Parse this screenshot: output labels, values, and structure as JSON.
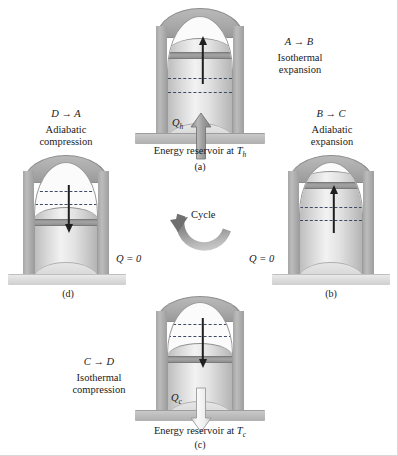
{
  "figure": {
    "center_label": "Cycle",
    "colors": {
      "background": "#ffffff",
      "cylinder_shell": "#a8a8a8",
      "gas": "#e2e2e2",
      "piston": "#9a9a9a",
      "reservoir_slab": "#bdbdbd",
      "insulating_stand": "#dcdcdc",
      "dashed_marker": "#3c4a66",
      "arrow": "#1f1f1f",
      "cycle_arrow": "#8c8c8c"
    }
  },
  "panels": {
    "a": {
      "id": "(a)",
      "transition": "A → B",
      "transition_from": "A",
      "transition_to": "B",
      "process_line1": "Isothermal",
      "process_line2": "expansion",
      "heat_symbol": "Q",
      "heat_subscript": "h",
      "heat_direction": "into-gas",
      "arrow_direction": "up",
      "arrow_meaning": "piston moves up",
      "reservoir_prefix": "Energy reservoir at ",
      "reservoir_symbol": "T",
      "reservoir_subscript": "h",
      "base_type": "hot-reservoir"
    },
    "b": {
      "id": "(b)",
      "transition": "B → C",
      "transition_from": "B",
      "transition_to": "C",
      "process_line1": "Adiabatic",
      "process_line2": "expansion",
      "heat_label": "Q = 0",
      "heat_symbol": "Q",
      "heat_value": "0",
      "arrow_direction": "up",
      "arrow_meaning": "piston moves up",
      "base_type": "insulating-stand"
    },
    "c": {
      "id": "(c)",
      "transition": "C → D",
      "transition_from": "C",
      "transition_to": "D",
      "process_line1": "Isothermal",
      "process_line2": "compression",
      "heat_symbol": "Q",
      "heat_subscript": "c",
      "heat_direction": "out-of-gas",
      "arrow_direction": "down",
      "arrow_meaning": "piston moves down",
      "reservoir_prefix": "Energy reservoir at ",
      "reservoir_symbol": "T",
      "reservoir_subscript": "c",
      "base_type": "cold-reservoir"
    },
    "d": {
      "id": "(d)",
      "transition": "D → A",
      "transition_from": "D",
      "transition_to": "A",
      "process_line1": "Adiabatic",
      "process_line2": "compression",
      "heat_label": "Q = 0",
      "heat_symbol": "Q",
      "heat_value": "0",
      "arrow_direction": "down",
      "arrow_meaning": "piston moves down",
      "base_type": "insulating-stand"
    }
  }
}
